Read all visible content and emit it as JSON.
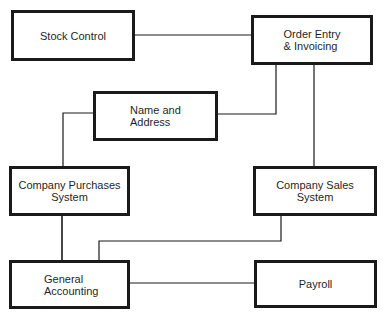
{
  "diagram": {
    "type": "system-relationship",
    "nodes": [
      {
        "id": "stock",
        "label": "Stock Control"
      },
      {
        "id": "order",
        "label": "Order Entry\n& Invoicing"
      },
      {
        "id": "name",
        "label": "Name and\nAddress"
      },
      {
        "id": "purchases",
        "label": "Company Purchases\nSystem"
      },
      {
        "id": "sales",
        "label": "Company Sales\nSystem"
      },
      {
        "id": "accounting",
        "label": "General\nAccounting"
      },
      {
        "id": "payroll",
        "label": "Payroll"
      }
    ],
    "edges": [
      {
        "from": "stock",
        "to": "order"
      },
      {
        "from": "order",
        "to": "name"
      },
      {
        "from": "order",
        "to": "sales"
      },
      {
        "from": "name",
        "to": "purchases"
      },
      {
        "from": "purchases",
        "to": "accounting"
      },
      {
        "from": "sales",
        "to": "accounting"
      },
      {
        "from": "accounting",
        "to": "payroll"
      }
    ],
    "colors": {
      "line": "#1a1a1a",
      "background": "#ffffff"
    }
  }
}
